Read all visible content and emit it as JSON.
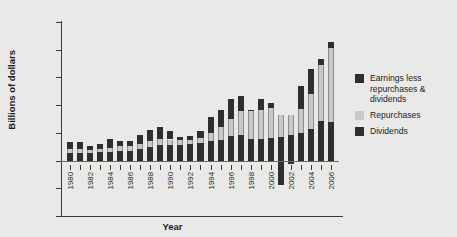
{
  "chart_data": {
    "type": "bar",
    "stacked": true,
    "title": "",
    "xlabel": "Year",
    "ylabel": "Billions of dollars",
    "ylim": [
      -400,
      1000
    ],
    "ytick_labels": [
      "1000",
      "800",
      "600",
      "400",
      "200",
      "0",
      "-200",
      "-400"
    ],
    "ytick_values": [
      1000,
      800,
      600,
      400,
      200,
      0,
      -200,
      -400
    ],
    "xtick_labels": [
      "1980",
      "1982",
      "1984",
      "1986",
      "1988",
      "1990",
      "1992",
      "1994",
      "1996",
      "1998",
      "2000",
      "2002",
      "2004",
      "2006"
    ],
    "grid": false,
    "legend_position": "right",
    "categories": [
      1980,
      1981,
      1982,
      1983,
      1984,
      1985,
      1986,
      1987,
      1988,
      1989,
      1990,
      1991,
      1992,
      1993,
      1994,
      1995,
      1996,
      1997,
      1998,
      1999,
      2000,
      2001,
      2002,
      2003,
      2004,
      2005,
      2006
    ],
    "series": [
      {
        "name": "Dividends",
        "color": "#2e2e2e",
        "values": [
          55,
          58,
          55,
          60,
          62,
          70,
          70,
          83,
          98,
          110,
          112,
          115,
          118,
          125,
          138,
          152,
          175,
          188,
          158,
          158,
          165,
          172,
          182,
          198,
          225,
          283,
          278
        ]
      },
      {
        "name": "Repurchases",
        "color": "#c9c9c9",
        "values": [
          28,
          28,
          22,
          25,
          30,
          35,
          32,
          38,
          45,
          45,
          40,
          32,
          30,
          38,
          60,
          90,
          122,
          168,
          198,
          208,
          215,
          158,
          148,
          172,
          258,
          408,
          535
        ]
      },
      {
        "name": "Earnings less repurchases & dividends",
        "color": "#2e2e2e",
        "values": [
          52,
          45,
          30,
          35,
          62,
          35,
          42,
          62,
          78,
          85,
          62,
          25,
          28,
          52,
          115,
          125,
          145,
          112,
          12,
          78,
          32,
          -175,
          -22,
          165,
          178,
          45,
          45
        ]
      }
    ]
  },
  "legend": {
    "items": [
      {
        "label": "Earnings less repurchases & dividends",
        "swatch": "sw-earn",
        "icon": "legend-swatch-dark"
      },
      {
        "label": "Repurchases",
        "swatch": "sw-rep",
        "icon": "legend-swatch-light"
      },
      {
        "label": "Dividends",
        "swatch": "sw-div",
        "icon": "legend-swatch-dark"
      }
    ]
  },
  "axis": {
    "x_title": "Year",
    "y_title": "Billions of dollars"
  },
  "colors": {
    "background": "#e9e9e7",
    "dark": "#2e2e2e",
    "light": "#c9c9c9",
    "axis": "#3a3a3a"
  }
}
